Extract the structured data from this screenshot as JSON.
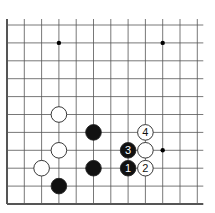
{
  "board": {
    "origin_x": 7,
    "origin_y": 204,
    "spacing_x": 17.3,
    "spacing_y": 17.9,
    "cols": 12,
    "rows": 11,
    "star_points": [
      [
        3,
        9
      ],
      [
        9,
        9
      ],
      [
        9,
        3
      ]
    ],
    "stones": [
      {
        "col": 3,
        "row": 5,
        "color": "white",
        "label": ""
      },
      {
        "col": 3,
        "row": 3,
        "color": "white",
        "label": ""
      },
      {
        "col": 2,
        "row": 2,
        "color": "white",
        "label": ""
      },
      {
        "col": 3,
        "row": 1,
        "color": "black",
        "label": ""
      },
      {
        "col": 5,
        "row": 4,
        "color": "black",
        "label": ""
      },
      {
        "col": 5,
        "row": 2,
        "color": "black",
        "label": ""
      },
      {
        "col": 7,
        "row": 2,
        "color": "black",
        "label": "1"
      },
      {
        "col": 8,
        "row": 2,
        "color": "white",
        "label": "2"
      },
      {
        "col": 7,
        "row": 3,
        "color": "black",
        "label": "3"
      },
      {
        "col": 8,
        "row": 4,
        "color": "white",
        "label": "4"
      },
      {
        "col": 8,
        "row": 3,
        "color": "white",
        "label": ""
      }
    ]
  }
}
